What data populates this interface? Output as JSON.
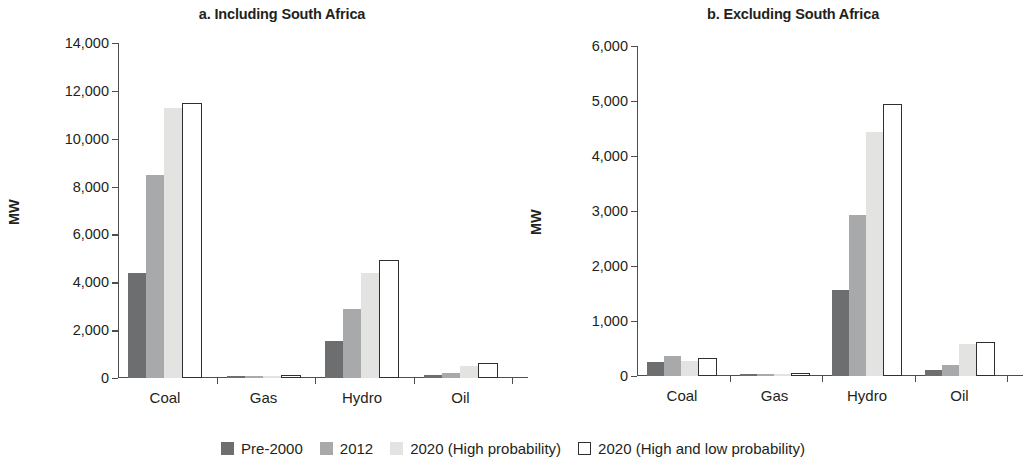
{
  "chart_data": [
    {
      "type": "bar",
      "panel_id": "a",
      "title": "a. Including South Africa",
      "xlabel": "",
      "ylabel": "MW",
      "categories": [
        "Coal",
        "Gas",
        "Hydro",
        "Oil"
      ],
      "ylim": [
        0,
        14000
      ],
      "yticks": [
        0,
        2000,
        4000,
        6000,
        8000,
        10000,
        12000,
        14000
      ],
      "ytick_labels": [
        "0",
        "2,000",
        "4,000",
        "6,000",
        "8,000",
        "10,000",
        "12,000",
        "14,000"
      ],
      "grid": false,
      "legend_position": "bottom",
      "series": [
        {
          "name": "Pre-2000",
          "color": "#6d6e70",
          "values": [
            4400,
            100,
            1550,
            110
          ]
        },
        {
          "name": "2012",
          "color": "#a7a9ab",
          "values": [
            8500,
            80,
            2900,
            200
          ]
        },
        {
          "name": "2020 (High probability)",
          "color": "#e3e3e1",
          "values": [
            11300,
            60,
            4400,
            520
          ]
        },
        {
          "name": "2020 (High and low probability)",
          "color": "#ffffff",
          "values": [
            11500,
            120,
            4950,
            620
          ]
        }
      ]
    },
    {
      "type": "bar",
      "panel_id": "b",
      "title": "b. Excluding South Africa",
      "xlabel": "",
      "ylabel": "MW",
      "categories": [
        "Coal",
        "Gas",
        "Hydro",
        "Oil"
      ],
      "ylim": [
        0,
        6000
      ],
      "yticks": [
        0,
        1000,
        2000,
        3000,
        4000,
        5000,
        6000
      ],
      "ytick_labels": [
        "0",
        "1,000",
        "2,000",
        "3,000",
        "4,000",
        "5,000",
        "6,000"
      ],
      "grid": false,
      "legend_position": "bottom",
      "series": [
        {
          "name": "Pre-2000",
          "color": "#6d6e70",
          "values": [
            250,
            40,
            1560,
            110
          ]
        },
        {
          "name": "2012",
          "color": "#a7a9ab",
          "values": [
            370,
            30,
            2930,
            200
          ]
        },
        {
          "name": "2020 (High probability)",
          "color": "#e3e3e1",
          "values": [
            270,
            20,
            4440,
            580
          ]
        },
        {
          "name": "2020 (High and low probability)",
          "color": "#ffffff",
          "values": [
            320,
            60,
            4950,
            620
          ]
        }
      ]
    }
  ],
  "legend": {
    "items": [
      {
        "label": "Pre-2000",
        "swatch": "filled-dark-gray-swatch"
      },
      {
        "label": "2012",
        "swatch": "filled-medium-gray-swatch"
      },
      {
        "label": "2020 (High probability)",
        "swatch": "filled-light-gray-swatch"
      },
      {
        "label": "2020 (High and low probability)",
        "swatch": "outlined-white-swatch"
      }
    ]
  },
  "colors": {
    "series_0": "#6d6e70",
    "series_1": "#a7a9ab",
    "series_2": "#e3e3e1",
    "series_3": "#ffffff",
    "axis": "#4d4d4f",
    "text": "#231f20",
    "background": "#ffffff"
  }
}
